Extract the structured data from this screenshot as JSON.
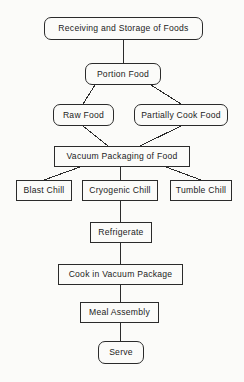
{
  "diagram": {
    "type": "flowchart",
    "background_color": "#fbfbf9",
    "line_color": "#2b2b2b",
    "text_color": "#1c1c1c",
    "nodes": [
      {
        "id": "receiving",
        "label": "Receiving and Storage of Foods",
        "shape": "round",
        "x": 44,
        "y": 17,
        "w": 159,
        "h": 23
      },
      {
        "id": "portion",
        "label": "Portion Food",
        "shape": "round",
        "x": 85,
        "y": 63,
        "w": 76,
        "h": 22
      },
      {
        "id": "raw",
        "label": "Raw Food",
        "shape": "round",
        "x": 53,
        "y": 104,
        "w": 61,
        "h": 22
      },
      {
        "id": "partially",
        "label": "Partially Cook Food",
        "shape": "round",
        "x": 134,
        "y": 104,
        "w": 94,
        "h": 22
      },
      {
        "id": "vacuum",
        "label": "Vacuum Packaging of Food",
        "shape": "sharp",
        "x": 54,
        "y": 146,
        "w": 136,
        "h": 21
      },
      {
        "id": "blast",
        "label": "Blast Chill",
        "shape": "sharp",
        "x": 16,
        "y": 180,
        "w": 56,
        "h": 21
      },
      {
        "id": "cryogenic",
        "label": "Cryogenic Chill",
        "shape": "sharp",
        "x": 82,
        "y": 180,
        "w": 76,
        "h": 21
      },
      {
        "id": "tumble",
        "label": "Tumble Chill",
        "shape": "sharp",
        "x": 170,
        "y": 180,
        "w": 62,
        "h": 21
      },
      {
        "id": "refrigerate",
        "label": "Refrigerate",
        "shape": "sharp",
        "x": 90,
        "y": 222,
        "w": 62,
        "h": 21
      },
      {
        "id": "cook",
        "label": "Cook in Vacuum Package",
        "shape": "sharp",
        "x": 58,
        "y": 264,
        "w": 125,
        "h": 21
      },
      {
        "id": "meal",
        "label": "Meal Assembly",
        "shape": "sharp",
        "x": 80,
        "y": 302,
        "w": 79,
        "h": 21
      },
      {
        "id": "serve",
        "label": "Serve",
        "shape": "round",
        "x": 98,
        "y": 341,
        "w": 46,
        "h": 23
      }
    ],
    "edges": [
      {
        "from": "receiving",
        "to": "portion",
        "kind": "vertical",
        "x1": 123,
        "y1": 40,
        "x2": 123,
        "y2": 63
      },
      {
        "from": "portion",
        "to": "raw",
        "kind": "diagonal",
        "x1": 95,
        "y1": 85,
        "x2": 83,
        "y2": 104
      },
      {
        "from": "portion",
        "to": "partially",
        "kind": "diagonal",
        "x1": 151,
        "y1": 85,
        "x2": 181,
        "y2": 104
      },
      {
        "from": "raw",
        "to": "vacuum",
        "kind": "diagonal",
        "x1": 83,
        "y1": 126,
        "x2": 108,
        "y2": 146
      },
      {
        "from": "partially",
        "to": "vacuum",
        "kind": "diagonal",
        "x1": 181,
        "y1": 126,
        "x2": 140,
        "y2": 146
      },
      {
        "from": "vacuum",
        "to": "blast",
        "kind": "diagonal",
        "x1": 80,
        "y1": 167,
        "x2": 44,
        "y2": 180
      },
      {
        "from": "vacuum",
        "to": "cryogenic",
        "kind": "vertical",
        "x1": 120,
        "y1": 167,
        "x2": 120,
        "y2": 180
      },
      {
        "from": "vacuum",
        "to": "tumble",
        "kind": "diagonal",
        "x1": 166,
        "y1": 167,
        "x2": 201,
        "y2": 180
      },
      {
        "from": "cryogenic",
        "to": "refrigerate",
        "kind": "vertical",
        "x1": 120,
        "y1": 201,
        "x2": 120,
        "y2": 222
      },
      {
        "from": "refrigerate",
        "to": "cook",
        "kind": "vertical",
        "x1": 120,
        "y1": 243,
        "x2": 120,
        "y2": 264
      },
      {
        "from": "cook",
        "to": "meal",
        "kind": "vertical",
        "x1": 120,
        "y1": 285,
        "x2": 120,
        "y2": 302
      },
      {
        "from": "meal",
        "to": "serve",
        "kind": "vertical",
        "x1": 120,
        "y1": 323,
        "x2": 120,
        "y2": 341
      }
    ]
  }
}
